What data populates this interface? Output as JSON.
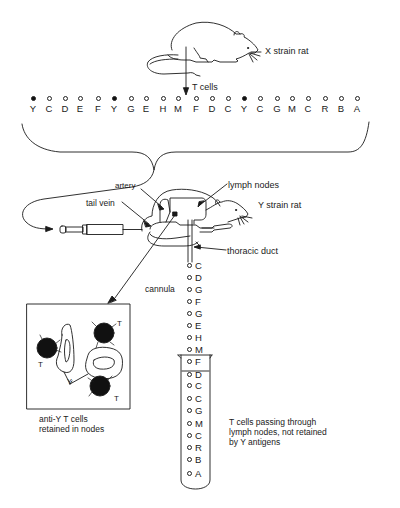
{
  "labels": {
    "x_strain_rat": "X strain rat",
    "t_cells": "T cells",
    "artery": "artery",
    "tail_vein": "tail vein",
    "lymph_nodes": "lymph nodes",
    "y_strain_rat": "Y strain rat",
    "thoracic_duct": "thoracic duct",
    "cannula": "cannula"
  },
  "captions": {
    "retained_line1": "anti-Y T cells",
    "retained_line2": "retained in nodes",
    "passing_line1": "T cells passing through",
    "passing_line2": "lymph nodes, not retained",
    "passing_line3": "by Y antigens"
  },
  "node_box": {
    "t_labels": [
      "T",
      "T",
      "T"
    ],
    "antigen_label": "Y"
  },
  "top_row_cells": [
    {
      "letter": "Y",
      "filled": true
    },
    {
      "letter": "C",
      "filled": false
    },
    {
      "letter": "D",
      "filled": false
    },
    {
      "letter": "E",
      "filled": false
    },
    {
      "letter": "F",
      "filled": false
    },
    {
      "letter": "Y",
      "filled": true
    },
    {
      "letter": "G",
      "filled": false
    },
    {
      "letter": "E",
      "filled": false
    },
    {
      "letter": "H",
      "filled": false
    },
    {
      "letter": "M",
      "filled": false
    },
    {
      "letter": "F",
      "filled": false
    },
    {
      "letter": "D",
      "filled": false
    },
    {
      "letter": "C",
      "filled": false
    },
    {
      "letter": "Y",
      "filled": true
    },
    {
      "letter": "C",
      "filled": false
    },
    {
      "letter": "G",
      "filled": false
    },
    {
      "letter": "M",
      "filled": false
    },
    {
      "letter": "C",
      "filled": false
    },
    {
      "letter": "R",
      "filled": false
    },
    {
      "letter": "B",
      "filled": false
    },
    {
      "letter": "A",
      "filled": false
    }
  ],
  "cannula_cells": [
    "C",
    "D",
    "G",
    "F",
    "G",
    "E",
    "H",
    "M",
    "F",
    "D",
    "C",
    "C",
    "G",
    "M",
    "C",
    "R",
    "B",
    "A"
  ]
}
